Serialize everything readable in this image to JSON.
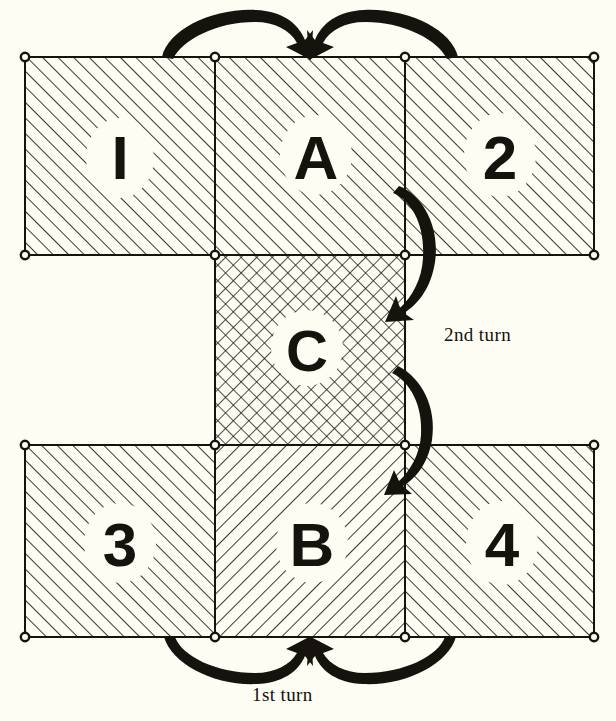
{
  "figure": {
    "background_color": "#fdfdf4",
    "ink_color": "#16130e",
    "panels": [
      {
        "id": "p1",
        "label": "I",
        "hatch": "diagonal-up",
        "x": 25,
        "y": 57,
        "w": 190,
        "h": 198,
        "label_x": 120,
        "label_y": 163
      },
      {
        "id": "pA",
        "label": "A",
        "hatch": "diagonal-up",
        "x": 215,
        "y": 57,
        "w": 190,
        "h": 198,
        "label_x": 316,
        "label_y": 163
      },
      {
        "id": "p2",
        "label": "2",
        "hatch": "diagonal-up",
        "x": 405,
        "y": 57,
        "w": 189,
        "h": 198,
        "label_x": 500,
        "label_y": 163
      },
      {
        "id": "pC",
        "label": "C",
        "hatch": "crosshatch",
        "x": 215,
        "y": 255,
        "w": 190,
        "h": 190,
        "label_x": 307,
        "label_y": 356
      },
      {
        "id": "p3",
        "label": "3",
        "hatch": "diagonal-up",
        "x": 25,
        "y": 445,
        "w": 190,
        "h": 192,
        "label_x": 120,
        "label_y": 550
      },
      {
        "id": "pB",
        "label": "B",
        "hatch": "diagonal-down",
        "x": 215,
        "y": 445,
        "w": 190,
        "h": 192,
        "label_x": 312,
        "label_y": 550
      },
      {
        "id": "p4",
        "label": "4",
        "hatch": "diagonal-up",
        "x": 405,
        "y": 445,
        "w": 189,
        "h": 192,
        "label_x": 502,
        "label_y": 550
      }
    ],
    "corner_markers": [
      {
        "cx": 25,
        "cy": 57
      },
      {
        "cx": 215,
        "cy": 57
      },
      {
        "cx": 405,
        "cy": 57
      },
      {
        "cx": 594,
        "cy": 57
      },
      {
        "cx": 25,
        "cy": 255
      },
      {
        "cx": 215,
        "cy": 255
      },
      {
        "cx": 405,
        "cy": 255
      },
      {
        "cx": 594,
        "cy": 255
      },
      {
        "cx": 215,
        "cy": 445
      },
      {
        "cx": 405,
        "cy": 445
      },
      {
        "cx": 25,
        "cy": 445
      },
      {
        "cx": 594,
        "cy": 445
      },
      {
        "cx": 25,
        "cy": 637
      },
      {
        "cx": 215,
        "cy": 637
      },
      {
        "cx": 405,
        "cy": 637
      },
      {
        "cx": 594,
        "cy": 637
      }
    ],
    "arrows": [
      {
        "id": "arrow-top-left",
        "direction": "right",
        "description": "top-left panel folds toward center"
      },
      {
        "id": "arrow-top-right",
        "direction": "left",
        "description": "top-right panel folds toward center"
      },
      {
        "id": "arrow-right-upper",
        "direction": "down",
        "description": "second turn upper arrow"
      },
      {
        "id": "arrow-right-lower",
        "direction": "down",
        "description": "second turn lower arrow"
      },
      {
        "id": "arrow-bottom-left",
        "direction": "right",
        "description": "bottom-left panel folds toward center"
      },
      {
        "id": "arrow-bottom-right",
        "direction": "left",
        "description": "bottom-right panel folds toward center"
      }
    ],
    "annotations": {
      "second_turn": "2nd turn",
      "first_turn": "1st turn"
    }
  }
}
